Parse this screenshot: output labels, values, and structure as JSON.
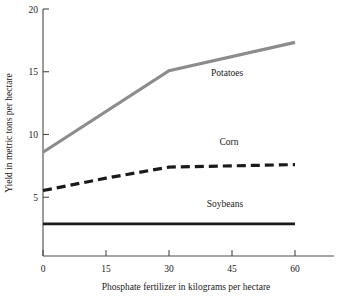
{
  "chart_data": {
    "type": "line",
    "title": "",
    "xlabel": "Phosphate fertilizer in kilograms per hectare",
    "ylabel": "Yield in metric tons per hectare",
    "xlim": [
      0,
      67
    ],
    "ylim": [
      0,
      20
    ],
    "xticks": [
      0,
      15,
      30,
      45,
      60
    ],
    "xtick_labels": [
      "0",
      "15",
      "30",
      "45",
      "60"
    ],
    "yticks": [
      5,
      10,
      15,
      20
    ],
    "ytick_labels": [
      "5",
      "10",
      "15",
      "20"
    ],
    "grid": false,
    "legend": "inline-labels",
    "series": [
      {
        "name": "Potatoes",
        "label": "Potatoes",
        "color": "#8c8c8c",
        "style": "solid",
        "width": 3.2,
        "x": [
          0,
          30,
          60
        ],
        "values": [
          8.4,
          15.0,
          17.3
        ],
        "label_x": 40,
        "label_y": 14.6
      },
      {
        "name": "Corn",
        "label": "Corn",
        "color": "#1a1a1a",
        "style": "dashed",
        "width": 3.2,
        "x": [
          0,
          15,
          30,
          45,
          60
        ],
        "values": [
          5.3,
          6.3,
          7.2,
          7.3,
          7.4
        ],
        "label_x": 42,
        "label_y": 9.0
      },
      {
        "name": "Soybeans",
        "label": "Soybeans",
        "color": "#1a1a1a",
        "style": "solid",
        "width": 2.6,
        "x": [
          0,
          60
        ],
        "values": [
          2.6,
          2.6
        ],
        "label_x": 39,
        "label_y": 4.0
      }
    ]
  },
  "axes": {
    "x_title": "Phosphate fertilizer in kilograms per hectare",
    "y_title": "Yield in metric tons per hectare",
    "x_tick_0": "0",
    "x_tick_1": "15",
    "x_tick_2": "30",
    "x_tick_3": "45",
    "x_tick_4": "60",
    "y_tick_5": "5",
    "y_tick_10": "10",
    "y_tick_15": "15",
    "y_tick_20": "20"
  },
  "labels": {
    "potatoes": "Potatoes",
    "corn": "Corn",
    "soybeans": "Soybeans"
  },
  "colors": {
    "potatoes_line": "#8c8c8c",
    "corn_line": "#1a1a1a",
    "soybeans_line": "#1a1a1a",
    "axis": "#4a4a4a",
    "text": "#1a1a1a",
    "background": "#ffffff"
  }
}
